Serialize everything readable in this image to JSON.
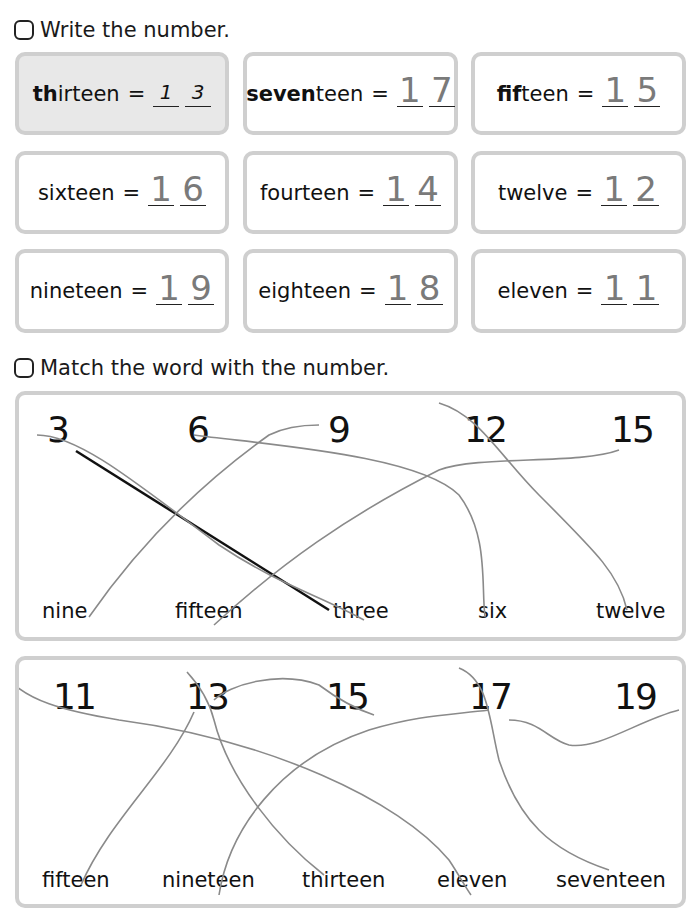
{
  "section1": {
    "instruction": "Write the number.",
    "items": [
      {
        "bold": "th",
        "rest": "irteen",
        "eq": "=",
        "answer": [
          "1",
          "3"
        ],
        "example": true
      },
      {
        "bold": "seven",
        "rest": "teen",
        "eq": "=",
        "answer": [
          "1",
          "7"
        ],
        "handwritten": true
      },
      {
        "bold": "fif",
        "rest": "teen",
        "eq": "=",
        "answer": [
          "1",
          "5"
        ],
        "handwritten": true
      },
      {
        "bold": "",
        "rest": "sixteen",
        "eq": "=",
        "answer": [
          "1",
          "6"
        ],
        "handwritten": true
      },
      {
        "bold": "",
        "rest": "fourteen",
        "eq": "=",
        "answer": [
          "1",
          "4"
        ],
        "handwritten": true
      },
      {
        "bold": "",
        "rest": "twelve",
        "eq": "=",
        "answer": [
          "1",
          "2"
        ],
        "handwritten": true
      },
      {
        "bold": "",
        "rest": "nineteen",
        "eq": "=",
        "answer": [
          "1",
          "9"
        ],
        "handwritten": true
      },
      {
        "bold": "",
        "rest": "eighteen",
        "eq": "=",
        "answer": [
          "1",
          "8"
        ],
        "handwritten": true
      },
      {
        "bold": "",
        "rest": "eleven",
        "eq": "=",
        "answer": [
          "1",
          "1"
        ],
        "handwritten": true
      }
    ]
  },
  "section2": {
    "instruction": "Match the word with the number.",
    "panel1": {
      "numbers": [
        "3",
        "6",
        "9",
        "12",
        "15"
      ],
      "words": [
        "nine",
        "fifteen",
        "three",
        "six",
        "twelve"
      ]
    },
    "panel2": {
      "numbers": [
        "11",
        "13",
        "15",
        "17",
        "19"
      ],
      "words": [
        "fifteen",
        "nineteen",
        "thirteen",
        "eleven",
        "seventeen"
      ]
    }
  },
  "colors": {
    "box_border": "#cfcfcf",
    "example_fill": "#e8e8e8",
    "pencil": "#8a8a8a",
    "example_line": "#111111"
  }
}
